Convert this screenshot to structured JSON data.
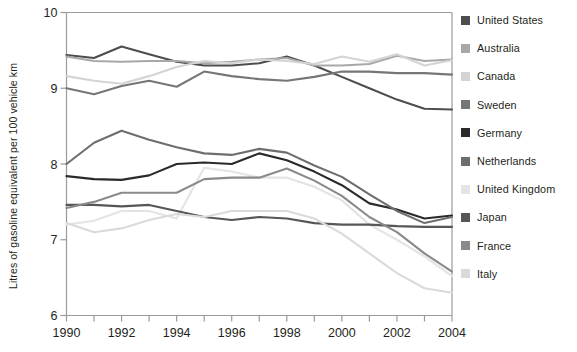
{
  "chart_data": {
    "type": "line",
    "title": "",
    "xlabel": "",
    "ylabel": "Litres of gasoline equivalent per 100 vehicle km",
    "x": [
      1990,
      1991,
      1992,
      1993,
      1994,
      1995,
      1996,
      1997,
      1998,
      1999,
      2000,
      2001,
      2002,
      2003,
      2004
    ],
    "xlim": [
      1990,
      2004
    ],
    "ylim": [
      6,
      10
    ],
    "xticks": [
      1990,
      1991,
      1992,
      1993,
      1994,
      1995,
      1996,
      1997,
      1998,
      1999,
      2000,
      2001,
      2002,
      2003,
      2004
    ],
    "xtick_labels": [
      "1990",
      "",
      "1992",
      "",
      "1994",
      "",
      "1996",
      "",
      "1998",
      "",
      "2000",
      "",
      "2002",
      "",
      "2004"
    ],
    "yticks": [
      6,
      7,
      8,
      9,
      10
    ],
    "ytick_labels": [
      "6",
      "7",
      "8",
      "9",
      "10"
    ],
    "grid": false,
    "legend_position": "right",
    "series": [
      {
        "name": "United States",
        "color": "#4d4d4d",
        "values": [
          9.44,
          9.4,
          9.55,
          9.45,
          9.35,
          9.3,
          9.3,
          9.33,
          9.42,
          9.3,
          9.15,
          9.0,
          8.85,
          8.73,
          8.72
        ]
      },
      {
        "name": "Australia",
        "color": "#a8a8a8",
        "values": [
          9.42,
          9.36,
          9.35,
          9.36,
          9.36,
          9.33,
          9.35,
          9.38,
          9.4,
          9.3,
          9.3,
          9.32,
          9.43,
          9.36,
          9.38
        ]
      },
      {
        "name": "Canada",
        "color": "#d4d4d4",
        "values": [
          9.16,
          9.1,
          9.06,
          9.16,
          9.28,
          9.36,
          9.33,
          9.38,
          9.36,
          9.32,
          9.42,
          9.35,
          9.45,
          9.3,
          9.37
        ]
      },
      {
        "name": "Sweden",
        "color": "#767676",
        "values": [
          9.0,
          8.92,
          9.03,
          9.1,
          9.02,
          9.22,
          9.16,
          9.12,
          9.1,
          9.15,
          9.22,
          9.22,
          9.2,
          9.2,
          9.18
        ]
      },
      {
        "name": "Germany",
        "color": "#2a2a2a",
        "values": [
          7.84,
          7.8,
          7.79,
          7.85,
          8.0,
          8.02,
          8.0,
          8.14,
          8.05,
          7.9,
          7.72,
          7.48,
          7.4,
          7.28,
          7.32
        ]
      },
      {
        "name": "Netherlands",
        "color": "#6e6e6e",
        "values": [
          8.0,
          8.28,
          8.44,
          8.32,
          8.22,
          8.14,
          8.12,
          8.2,
          8.15,
          7.98,
          7.83,
          7.6,
          7.38,
          7.22,
          7.3
        ]
      },
      {
        "name": "United Kingdom",
        "color": "#e4e4e4",
        "values": [
          7.2,
          7.25,
          7.38,
          7.38,
          7.28,
          7.95,
          7.9,
          7.82,
          7.82,
          7.7,
          7.52,
          7.2,
          7.0,
          6.78,
          6.52
        ]
      },
      {
        "name": "Japan",
        "color": "#565656",
        "values": [
          7.46,
          7.46,
          7.44,
          7.46,
          7.38,
          7.3,
          7.26,
          7.3,
          7.28,
          7.22,
          7.2,
          7.2,
          7.18,
          7.17,
          7.17
        ]
      },
      {
        "name": "France",
        "color": "#8a8a8a",
        "values": [
          7.42,
          7.5,
          7.62,
          7.62,
          7.62,
          7.8,
          7.82,
          7.82,
          7.94,
          7.78,
          7.58,
          7.3,
          7.1,
          6.82,
          6.58
        ]
      },
      {
        "name": "Italy",
        "color": "#dadada",
        "values": [
          7.22,
          7.1,
          7.15,
          7.26,
          7.34,
          7.3,
          7.38,
          7.38,
          7.38,
          7.28,
          7.08,
          6.82,
          6.56,
          6.36,
          6.3
        ]
      }
    ]
  },
  "axes": {
    "y_axis_title": "Litres of gasoline equivalent per 100 vehicle km"
  }
}
